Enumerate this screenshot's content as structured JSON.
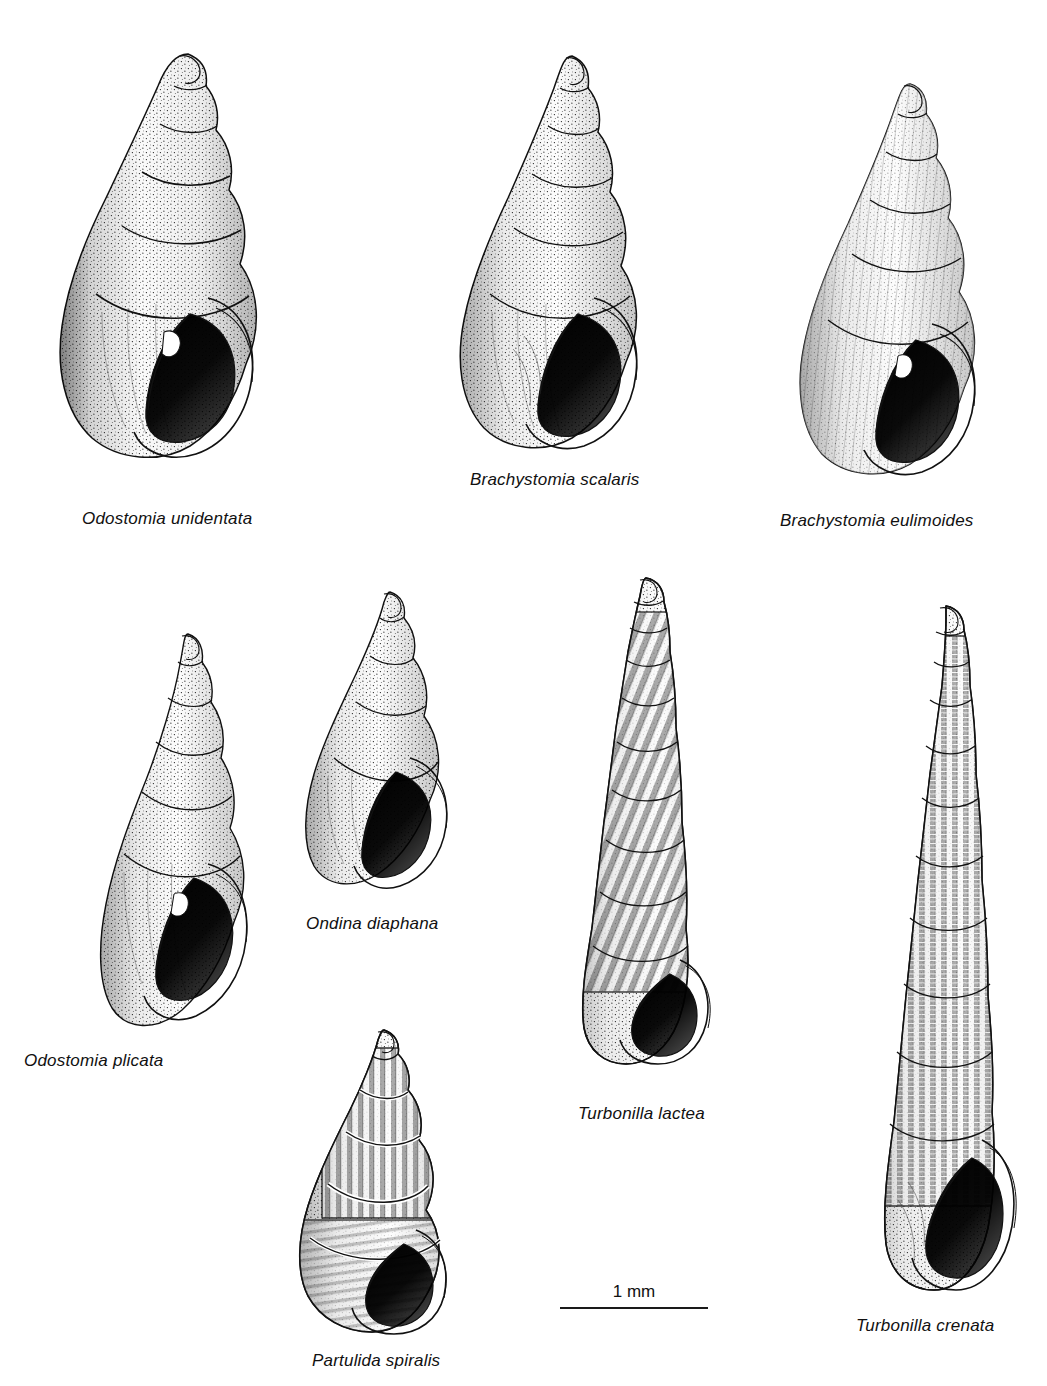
{
  "plate": {
    "background_color": "#ffffff",
    "ink_color": "#111111",
    "kind": "scientific-illustration-plate",
    "subject": "Pyramidellidae sea snail shells",
    "technique": "stipple line drawing"
  },
  "scale_bar": {
    "label": "1 mm",
    "length_px": 148
  },
  "figures": [
    {
      "id": "odostomia-unidentata",
      "caption": "Odostomia unidentata",
      "shell_type": "smooth",
      "whorls": 6,
      "has_aperture": true,
      "has_columellar_tooth": true,
      "fig_x": 40,
      "fig_y": 46,
      "fig_w": 260,
      "fig_h": 430,
      "caption_x": 82,
      "caption_y": 510
    },
    {
      "id": "brachystomia-scalaris",
      "caption": "Brachystomia scalaris",
      "shell_type": "smooth",
      "whorls": 6,
      "has_aperture": true,
      "has_columellar_tooth": false,
      "fig_x": 448,
      "fig_y": 50,
      "fig_w": 230,
      "fig_h": 400,
      "caption_x": 470,
      "caption_y": 471
    },
    {
      "id": "brachystomia-eulimoides",
      "caption": "Brachystomia eulimoides",
      "shell_type": "smooth-striate",
      "whorls": 6,
      "has_aperture": true,
      "has_columellar_tooth": true,
      "fig_x": 792,
      "fig_y": 78,
      "fig_w": 222,
      "fig_h": 400,
      "caption_x": 780,
      "caption_y": 512
    },
    {
      "id": "odostomia-plicata",
      "caption": "Odostomia plicata",
      "shell_type": "smooth",
      "whorls": 6,
      "has_aperture": true,
      "has_columellar_tooth": true,
      "fig_x": 96,
      "fig_y": 628,
      "fig_w": 180,
      "fig_h": 420,
      "caption_x": 24,
      "caption_y": 1052
    },
    {
      "id": "ondina-diaphana",
      "caption": "Ondina diaphana",
      "shell_type": "smooth",
      "whorls": 5,
      "has_aperture": true,
      "has_columellar_tooth": false,
      "fig_x": 302,
      "fig_y": 586,
      "fig_w": 158,
      "fig_h": 312,
      "caption_x": 306,
      "caption_y": 915
    },
    {
      "id": "partulida-spiralis",
      "caption": "Partulida spiralis",
      "shell_type": "ribbed-spiral",
      "whorls": 6,
      "has_aperture": true,
      "has_columellar_tooth": false,
      "fig_x": 292,
      "fig_y": 1024,
      "fig_w": 180,
      "fig_h": 312,
      "caption_x": 312,
      "caption_y": 1352
    },
    {
      "id": "turbonilla-lactea",
      "caption": "Turbonilla lactea",
      "shell_type": "oblique-ribbed",
      "whorls": 11,
      "has_aperture": true,
      "has_columellar_tooth": false,
      "fig_x": 572,
      "fig_y": 572,
      "fig_w": 158,
      "fig_h": 500,
      "caption_x": 578,
      "caption_y": 1105
    },
    {
      "id": "turbonilla-crenata",
      "caption": "Turbonilla crenata",
      "shell_type": "cancellate-ribbed",
      "whorls": 12,
      "has_aperture": true,
      "has_columellar_tooth": false,
      "fig_x": 864,
      "fig_y": 600,
      "fig_w": 172,
      "fig_h": 700,
      "caption_x": 856,
      "caption_y": 1317
    }
  ]
}
